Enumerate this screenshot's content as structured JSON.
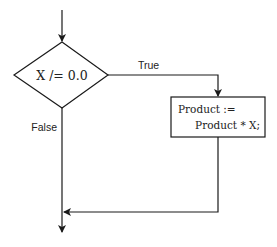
{
  "flowchart": {
    "decision": {
      "condition": "X /= 0.0"
    },
    "branches": {
      "true_label": "True",
      "false_label": "False"
    },
    "process": {
      "line1": "Product :=",
      "line2": "Product * X;"
    },
    "colors": {
      "stroke": "#1a1a1a",
      "text": "#222222",
      "background": "#ffffff"
    }
  }
}
